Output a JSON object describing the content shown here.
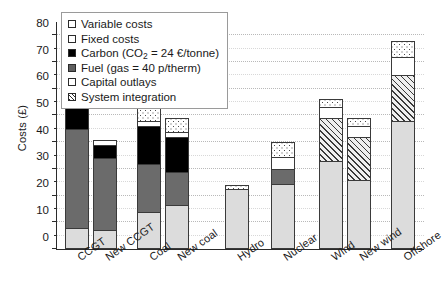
{
  "chart_data": {
    "type": "bar",
    "stacked": true,
    "title": "",
    "xlabel": "",
    "ylabel": "Costs (£)",
    "ylim": [
      0,
      85
    ],
    "yticks": [
      0,
      10,
      20,
      30,
      40,
      50,
      60,
      70,
      80
    ],
    "ytick_labels": [
      "0",
      "10",
      "20",
      "30",
      "40",
      "50",
      "60",
      "70",
      "80"
    ],
    "grid": true,
    "legend_position": "upper-left",
    "categories": [
      "CCGT",
      "New CCGT",
      "Coal",
      "New coal",
      "Hydro",
      "Nuclear",
      "Wind",
      "New wind",
      "Offshore"
    ],
    "series": [
      {
        "name": "Capital outlays",
        "key": "capital",
        "values": [
          8,
          7,
          14,
          16.5,
          22.5,
          24.5,
          33,
          26,
          48
        ]
      },
      {
        "name": "Fuel (gas = 40 p/therm)",
        "key": "fuel",
        "values": [
          37,
          27,
          18,
          12.5,
          0,
          5.5,
          0,
          0,
          0
        ]
      },
      {
        "name": "Carbon (CO2 = 24 €/tonne)",
        "key": "carbon",
        "values": [
          8,
          5,
          14,
          13,
          0,
          0,
          0,
          0,
          0
        ]
      },
      {
        "name": "System integration",
        "key": "integration",
        "values": [
          0,
          0,
          0,
          0,
          0,
          0,
          16,
          16,
          17
        ]
      },
      {
        "name": "Fixed costs",
        "key": "fixed",
        "values": [
          2,
          2,
          2,
          2,
          0,
          4.5,
          4,
          4,
          7
        ]
      },
      {
        "name": "Variable costs",
        "key": "variable",
        "values": [
          0,
          0,
          5,
          5,
          1.5,
          5.5,
          3,
          3,
          6
        ]
      }
    ],
    "totals": [
      55,
      41,
      53,
      49,
      24,
      40,
      56,
      49,
      78
    ],
    "annotations": []
  },
  "legend": {
    "items": [
      {
        "label": "Variable costs",
        "swatch": "variable"
      },
      {
        "label": "Fixed costs",
        "swatch": "fixed"
      },
      {
        "label": "Carbon (CO₂ = 24 €/tonne)",
        "swatch": "carbon",
        "rich": true
      },
      {
        "label": "Fuel (gas = 40 p/therm)",
        "swatch": "fuel"
      },
      {
        "label": "Capital outlays",
        "swatch": "capital"
      },
      {
        "label": "System integration",
        "swatch": "integration"
      }
    ]
  },
  "colors": {
    "variable": "#ffffff",
    "fixed": "#ffffff",
    "carbon": "#000000",
    "fuel": "#6b6b6b",
    "capital": "#dcdcdc",
    "integration": "#efefef",
    "axis": "#2b2b2b",
    "grid": "#b9b9b9"
  }
}
